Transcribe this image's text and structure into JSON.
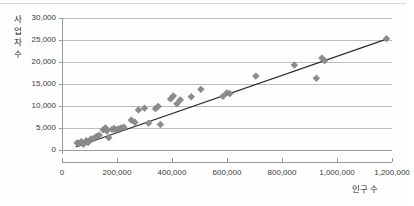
{
  "chart_data": {
    "type": "scatter",
    "title": "",
    "xlabel": "인구 수",
    "ylabel": "사업자 수",
    "xlim": [
      0,
      1200000
    ],
    "ylim": [
      0,
      30000
    ],
    "grid": true,
    "legend": false,
    "xticks": [
      "0",
      "200,000",
      "400,000",
      "600,000",
      "800,000",
      "1,000,000",
      "1,200,000"
    ],
    "xtick_values": [
      0,
      200000,
      400000,
      600000,
      800000,
      1000000,
      1200000
    ],
    "yticks": [
      "0",
      "5,000",
      "10,000",
      "15,000",
      "20,000",
      "25,000",
      "30,000"
    ],
    "ytick_values": [
      0,
      5000,
      10000,
      15000,
      20000,
      25000,
      30000
    ],
    "marker": "diamond",
    "marker_color": "#8c8c8c",
    "trendline": {
      "visible": true,
      "color": "#2a2a2a",
      "x": [
        50000,
        1180000
      ],
      "y": [
        700,
        25200
      ]
    },
    "points": [
      {
        "x": 55000,
        "y": 1600
      },
      {
        "x": 62000,
        "y": 1500
      },
      {
        "x": 70000,
        "y": 1900
      },
      {
        "x": 78000,
        "y": 1300
      },
      {
        "x": 88000,
        "y": 2100
      },
      {
        "x": 95000,
        "y": 1700
      },
      {
        "x": 105000,
        "y": 2500
      },
      {
        "x": 115000,
        "y": 2600
      },
      {
        "x": 125000,
        "y": 3100
      },
      {
        "x": 135000,
        "y": 3400
      },
      {
        "x": 150000,
        "y": 4600
      },
      {
        "x": 158000,
        "y": 5000
      },
      {
        "x": 163000,
        "y": 4300
      },
      {
        "x": 170000,
        "y": 2800
      },
      {
        "x": 182000,
        "y": 4700
      },
      {
        "x": 190000,
        "y": 4900
      },
      {
        "x": 196000,
        "y": 4500
      },
      {
        "x": 205000,
        "y": 4800
      },
      {
        "x": 215000,
        "y": 5000
      },
      {
        "x": 225000,
        "y": 5200
      },
      {
        "x": 252000,
        "y": 6800
      },
      {
        "x": 265000,
        "y": 6300
      },
      {
        "x": 278000,
        "y": 9100
      },
      {
        "x": 300000,
        "y": 9500
      },
      {
        "x": 315000,
        "y": 6100
      },
      {
        "x": 340000,
        "y": 9400
      },
      {
        "x": 350000,
        "y": 9900
      },
      {
        "x": 358000,
        "y": 5800
      },
      {
        "x": 395000,
        "y": 11600
      },
      {
        "x": 405000,
        "y": 12300
      },
      {
        "x": 418000,
        "y": 10500
      },
      {
        "x": 430000,
        "y": 11400
      },
      {
        "x": 470000,
        "y": 12100
      },
      {
        "x": 505000,
        "y": 13800
      },
      {
        "x": 585000,
        "y": 12200
      },
      {
        "x": 600000,
        "y": 13000
      },
      {
        "x": 610000,
        "y": 12800
      },
      {
        "x": 705000,
        "y": 16800
      },
      {
        "x": 845000,
        "y": 19300
      },
      {
        "x": 925000,
        "y": 16300
      },
      {
        "x": 945000,
        "y": 20900
      },
      {
        "x": 955000,
        "y": 20300
      },
      {
        "x": 1180000,
        "y": 25300
      }
    ]
  }
}
